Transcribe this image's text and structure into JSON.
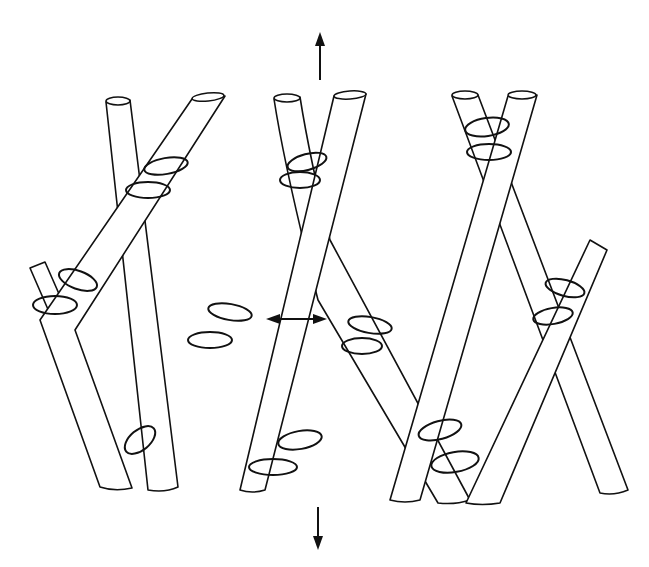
{
  "figure": {
    "caption_partial": "",
    "poles": [
      {
        "id": "pole-1",
        "direction": "down-right",
        "top": [
          118,
          100
        ],
        "bottom": [
          160,
          490
        ]
      },
      {
        "id": "pole-2",
        "direction": "down-left",
        "top": [
          208,
          97
        ],
        "bottom": [
          115,
          487
        ]
      },
      {
        "id": "pole-3",
        "direction": "down-right",
        "top": [
          287,
          97
        ],
        "bottom": [
          445,
          500
        ]
      },
      {
        "id": "pole-4",
        "direction": "down-left",
        "top": [
          350,
          95
        ],
        "bottom": [
          252,
          490
        ]
      },
      {
        "id": "pole-5",
        "direction": "down-right",
        "top": [
          465,
          95
        ],
        "bottom": [
          615,
          493
        ]
      },
      {
        "id": "pole-6",
        "direction": "down-left",
        "top": [
          522,
          95
        ],
        "bottom": [
          405,
          500
        ]
      },
      {
        "id": "stub-left",
        "direction": "down-right",
        "top": [
          38,
          265
        ],
        "bottom": [
          72,
          330
        ]
      },
      {
        "id": "pole-7",
        "direction": "down-left",
        "top": [
          600,
          245
        ],
        "bottom": [
          482,
          500
        ]
      }
    ],
    "arrows": [
      {
        "id": "arrow-up",
        "direction": "up",
        "from": [
          320,
          80
        ],
        "to": [
          320,
          32
        ]
      },
      {
        "id": "arrow-horizontal",
        "direction": "both",
        "from": [
          266,
          319
        ],
        "to": [
          327,
          319
        ]
      },
      {
        "id": "arrow-down",
        "direction": "down",
        "from": [
          318,
          507
        ],
        "to": [
          318,
          550
        ]
      }
    ],
    "lashings_count": 16,
    "colors": {
      "line": "#111111",
      "background": "#ffffff"
    }
  }
}
